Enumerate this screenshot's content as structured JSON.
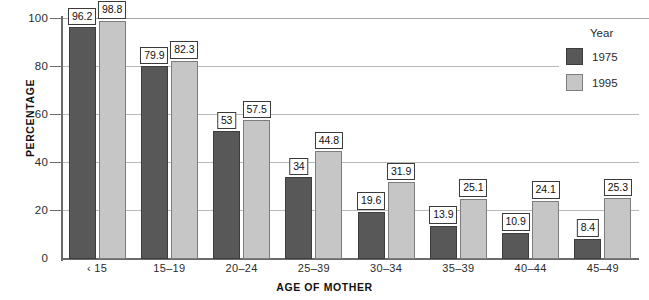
{
  "chart_data": {
    "type": "bar",
    "title": "",
    "xlabel": "AGE OF MOTHER",
    "ylabel": "PERCENTAGE",
    "ylim": [
      0,
      100
    ],
    "yticks": [
      0,
      20,
      40,
      60,
      80,
      100
    ],
    "grid": true,
    "legend_position": "top-right",
    "legend_title": "Year",
    "categories": [
      "‹ 15",
      "15–19",
      "20–24",
      "25–39",
      "30–34",
      "35–39",
      "40–44",
      "45–49"
    ],
    "series": [
      {
        "name": "1975",
        "color": "#585858",
        "values": [
          96.2,
          79.9,
          53,
          34,
          19.6,
          13.9,
          10.9,
          8.4
        ],
        "labels": [
          "96.2",
          "79.9",
          "53",
          "34",
          "19.6",
          "13.9",
          "10.9",
          "8.4"
        ]
      },
      {
        "name": "1995",
        "color": "#c6c6c6",
        "values": [
          98.8,
          82.3,
          57.5,
          44.8,
          31.9,
          25.1,
          24.1,
          25.3
        ],
        "labels": [
          "98.8",
          "82.3",
          "57.5",
          "44.8",
          "31.9",
          "25.1",
          "24.1",
          "25.3"
        ]
      }
    ]
  },
  "axes": {
    "y_title": "PERCENTAGE",
    "x_title": "AGE OF MOTHER",
    "y_tick_labels": [
      "100",
      "80",
      "60",
      "40",
      "20",
      "0"
    ]
  },
  "legend": {
    "title": "Year",
    "items": [
      {
        "label": "1975",
        "color": "#585858"
      },
      {
        "label": "1995",
        "color": "#c6c6c6"
      }
    ]
  }
}
